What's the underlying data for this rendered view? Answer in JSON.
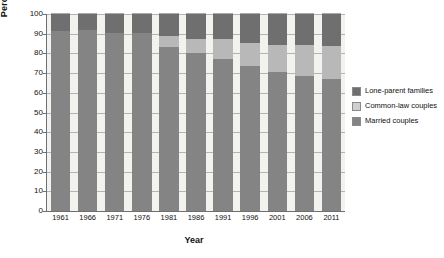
{
  "chart_data": {
    "type": "bar",
    "title": "",
    "xlabel": "Year",
    "ylabel": "Percentage",
    "ylim": [
      0,
      100
    ],
    "yticks": [
      0,
      10,
      20,
      30,
      40,
      50,
      60,
      70,
      80,
      90,
      100
    ],
    "grid": true,
    "stacked": true,
    "legend_position": "right",
    "categories": [
      "1961",
      "1966",
      "1971",
      "1976",
      "1981",
      "1986",
      "1991",
      "1996",
      "2001",
      "2006",
      "2011"
    ],
    "series": [
      {
        "name": "Married couples",
        "color": "#848484",
        "values": [
          91.6,
          92.0,
          90.6,
          90.2,
          83.1,
          80.2,
          77.2,
          73.7,
          70.5,
          68.6,
          67.0
        ]
      },
      {
        "name": "Common-law couples",
        "color": "#b8b8b8",
        "values": [
          0.0,
          0.0,
          0.0,
          0.0,
          5.6,
          7.2,
          9.9,
          11.7,
          13.8,
          15.5,
          16.7
        ]
      },
      {
        "name": "Lone-parent families",
        "color": "#6f6f6f",
        "values": [
          8.4,
          8.0,
          9.4,
          9.8,
          11.3,
          12.6,
          12.9,
          14.6,
          15.7,
          15.9,
          16.3
        ]
      }
    ]
  },
  "legend": {
    "items": [
      {
        "label": "Lone-parent families",
        "swatch": "sw-lone"
      },
      {
        "label": "Common-law couples",
        "swatch": "sw-common"
      },
      {
        "label": "Married couples",
        "swatch": "sw-married"
      }
    ]
  }
}
